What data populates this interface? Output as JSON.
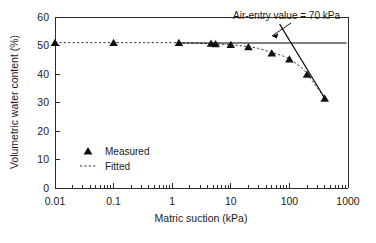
{
  "chart_data": {
    "type": "scatter",
    "title": "",
    "xlabel": "Matric suction (kPa)",
    "ylabel": "Volumetric water content (%)",
    "xscale": "log",
    "xlim": [
      0.01,
      1000
    ],
    "ylim": [
      0,
      60
    ],
    "xticks": [
      "0.01",
      "0.1",
      "1",
      "10",
      "100",
      "1000"
    ],
    "xtick_values": [
      0.01,
      0.1,
      1,
      10,
      100,
      1000
    ],
    "yticks": [
      "0",
      "10",
      "20",
      "30",
      "40",
      "50",
      "60"
    ],
    "ytick_values": [
      0,
      10,
      20,
      30,
      40,
      50,
      60
    ],
    "grid": false,
    "legend_position": "inside-lower-left",
    "series": [
      {
        "name": "Measured",
        "marker": "triangle",
        "x": [
          0.01,
          0.1,
          1.3,
          4.6,
          5.5,
          10,
          20,
          50,
          100,
          200,
          400
        ],
        "y": [
          51.0,
          51.0,
          51.0,
          50.7,
          50.5,
          50.3,
          49.5,
          47.3,
          45.2,
          39.8,
          31.4
        ]
      },
      {
        "name": "Fitted",
        "marker": "dashed-line",
        "x": [
          0.01,
          0.1,
          1,
          3,
          5,
          10,
          20,
          30,
          50,
          80,
          100,
          150,
          200,
          300,
          400
        ],
        "y": [
          51.0,
          51.0,
          51.0,
          50.8,
          50.6,
          50.3,
          49.6,
          49.0,
          47.6,
          46.2,
          45.3,
          42.8,
          40.2,
          35.2,
          31.4
        ]
      }
    ],
    "annotations": [
      {
        "name": "air-entry-value",
        "text": "Air-entry value = 70 kPa",
        "value": 70,
        "unit": "kPa"
      }
    ],
    "construction_lines": [
      {
        "name": "saturated-plateau-line",
        "type": "horizontal",
        "y": 50.9,
        "x_from": 1.3,
        "x_to": 950
      },
      {
        "name": "steepest-slope-tangent",
        "type": "tangent",
        "x_from": 68,
        "y_from": 57.5,
        "x_to": 430,
        "y_to": 30.5
      }
    ]
  },
  "legend": {
    "items": [
      {
        "label": "Measured",
        "marker": "triangle"
      },
      {
        "label": "Fitted",
        "marker": "dashed-line"
      }
    ]
  },
  "axes": {
    "x_title": "Matric suction (kPa)",
    "y_title": "Volumetric water content (%)",
    "x_tick_labels": [
      "0.01",
      "0.1",
      "1",
      "10",
      "100",
      "1000"
    ],
    "y_tick_labels": [
      "0",
      "10",
      "20",
      "30",
      "40",
      "50",
      "60"
    ]
  },
  "annotation": {
    "air_entry_text": "Air-entry value = 70 kPa"
  }
}
